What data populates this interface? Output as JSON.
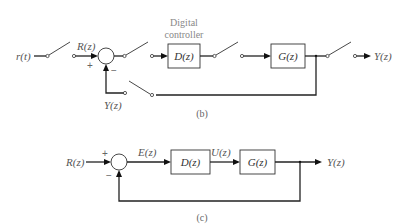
{
  "diagram_b": {
    "caption": "(b)",
    "input_signal": "r(t)",
    "sampled_input": "R(z)",
    "controller_title_line1": "Digital",
    "controller_title_line2": "controller",
    "controller_block": "D(z)",
    "plant_block": "G(z)",
    "output": "Y(z)",
    "feedback_signal": "Y(z)",
    "sum_plus": "+",
    "sum_minus": "−"
  },
  "diagram_c": {
    "caption": "(c)",
    "input": "R(z)",
    "error": "E(z)",
    "controller_block": "D(z)",
    "control_signal": "U(z)",
    "plant_block": "G(z)",
    "output": "Y(z)",
    "sum_plus": "+",
    "sum_minus": "−"
  },
  "colors": {
    "line": "#222222",
    "label": "#555555",
    "background": "#ffffff"
  }
}
